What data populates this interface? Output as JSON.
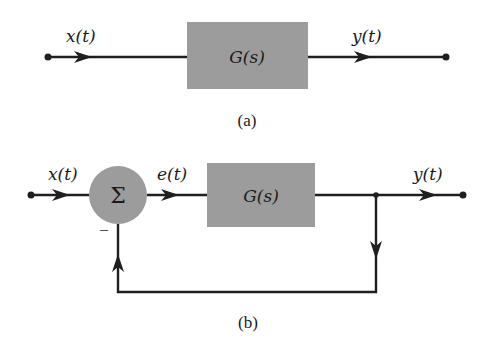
{
  "diagram_a": {
    "input_label": "x(t)",
    "block_label": "G(s)",
    "output_label": "y(t)",
    "caption": "(a)"
  },
  "diagram_b": {
    "input_label": "x(t)",
    "summer_symbol": "Σ",
    "feedback_sign": "−",
    "error_label": "e(t)",
    "block_label": "G(s)",
    "output_label": "y(t)",
    "caption": "(b)"
  },
  "colors": {
    "block_fill": "#9c9c9c",
    "line": "#1f1f1f",
    "background": "#ffffff"
  }
}
